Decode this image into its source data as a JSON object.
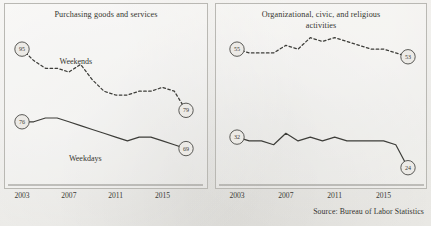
{
  "source_note": "Source: Bureau of Labor Statistics",
  "axis": {
    "ticks": [
      "2003",
      "2007",
      "2011",
      "2015"
    ],
    "tick_years": [
      2003,
      2007,
      2011,
      2015
    ]
  },
  "chart_data": [
    {
      "type": "line",
      "title": "Purchasing goods and services",
      "xlabel": "",
      "ylabel": "",
      "xlim": [
        2003,
        2017
      ],
      "ylim": [
        60,
        100
      ],
      "grid": false,
      "legend": "inline-labels",
      "x": [
        2003,
        2004,
        2005,
        2006,
        2007,
        2008,
        2009,
        2010,
        2011,
        2012,
        2013,
        2014,
        2015,
        2016,
        2017
      ],
      "series": [
        {
          "name": "Weekends",
          "style": "dashed",
          "values": [
            95,
            92,
            90,
            90,
            89,
            91,
            87,
            84,
            83,
            83,
            84,
            84,
            85,
            84,
            79
          ],
          "start_label": "95",
          "end_label": "79"
        },
        {
          "name": "Weekdays",
          "style": "solid",
          "values": [
            76,
            76,
            77,
            77,
            76,
            75,
            74,
            73,
            72,
            71,
            72,
            72,
            71,
            70,
            69
          ],
          "start_label": "76",
          "end_label": "69"
        }
      ]
    },
    {
      "type": "line",
      "title": "Organizational, civic, and religious activities",
      "title_line1": "Organizational, civic, and religious",
      "title_line2": "activities",
      "xlabel": "",
      "ylabel": "",
      "xlim": [
        2003,
        2017
      ],
      "ylim": [
        20,
        60
      ],
      "grid": false,
      "legend": "none",
      "x": [
        2003,
        2004,
        2005,
        2006,
        2007,
        2008,
        2009,
        2010,
        2011,
        2012,
        2013,
        2014,
        2015,
        2016,
        2017
      ],
      "series": [
        {
          "name": "Weekends",
          "style": "dashed",
          "values": [
            55,
            54,
            54,
            54,
            56,
            55,
            58,
            57,
            58,
            57,
            56,
            55,
            55,
            54,
            53
          ],
          "start_label": "55",
          "end_label": "53"
        },
        {
          "name": "Weekdays",
          "style": "solid",
          "values": [
            32,
            31,
            31,
            30,
            33,
            31,
            32,
            31,
            32,
            31,
            31,
            31,
            31,
            30,
            24
          ],
          "start_label": "32",
          "end_label": "24"
        }
      ]
    }
  ],
  "left_panel": {
    "title": "Purchasing goods and services",
    "label_weekends": "Weekends",
    "label_weekdays": "Weekdays"
  },
  "right_panel": {
    "title_line1": "Organizational, civic, and religious",
    "title_line2": "activities"
  }
}
